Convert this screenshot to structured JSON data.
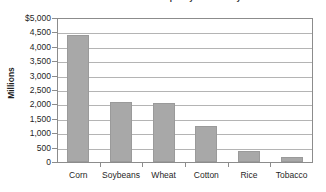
{
  "chart_data": {
    "type": "bar",
    "title": "U.S. Farm Cash Receipts by Commodity",
    "categories": [
      "Corn",
      "Soybeans",
      "Wheat",
      "Cotton",
      "Rice",
      "Tobacco"
    ],
    "values": [
      4450,
      2100,
      2050,
      1250,
      400,
      190
    ],
    "xlabel": "",
    "ylabel": "Millions",
    "ylim": [
      0,
      5000
    ],
    "ytick_labels": [
      "$5,000",
      "4,500",
      "4,000",
      "3,500",
      "3,000",
      "2,500",
      "2,000",
      "1,500",
      "1,000",
      "500",
      "0"
    ],
    "ytick_values": [
      5000,
      4500,
      4000,
      3500,
      3000,
      2500,
      2000,
      1500,
      1000,
      500,
      0
    ],
    "grid": true,
    "legend": "none",
    "bar_color": "#a8a8a8",
    "gridline_color": "#b4b4b4",
    "axis_color": "#8c8c8c"
  }
}
